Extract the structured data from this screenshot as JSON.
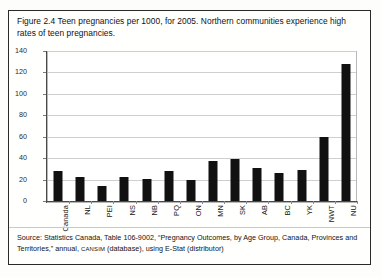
{
  "figure": {
    "caption": "Figure 2.4 Teen pregnancies per 1000, for 2005. Northern communities experience high rates of teen pregnancies.",
    "source_prefix": "Source: Statistics Canada, Table 106-9002, “Pregnancy Outcomes, by Age Group, Canada, Provinces and Territories,” annual, ",
    "source_smallcaps": "CANSIM",
    "source_suffix": " (database), using E-Stat (distributor)"
  },
  "chart_data": {
    "type": "bar",
    "title": "",
    "xlabel": "",
    "ylabel": "",
    "ylim": [
      0,
      140
    ],
    "yticks": [
      0,
      20,
      40,
      60,
      80,
      100,
      120,
      140
    ],
    "grid": true,
    "legend": false,
    "bar_color": "#111111",
    "categories": [
      "Canada",
      "NL",
      "PEI",
      "NS",
      "NB",
      "PQ",
      "ON",
      "MN",
      "SK",
      "AB",
      "BC",
      "YK",
      "NWT",
      "NU"
    ],
    "values": [
      28,
      22,
      14,
      22,
      21,
      28,
      20,
      37,
      39,
      31,
      26,
      29,
      60,
      128
    ]
  }
}
